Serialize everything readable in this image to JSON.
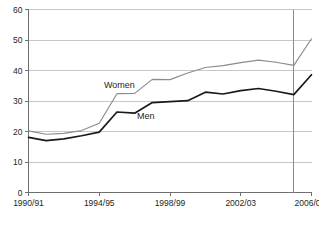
{
  "chart_data": {
    "type": "line",
    "title": "",
    "subtitle": "",
    "xlabel": "",
    "ylabel": "",
    "ylim": [
      0,
      60
    ],
    "ytick_step": 10,
    "yticks": [
      "0",
      "10",
      "20",
      "30",
      "40",
      "50",
      "60"
    ],
    "grid": true,
    "legend_position": "inline-labels",
    "categories": [
      "1990/91",
      "1991/92",
      "1992/93",
      "1993/94",
      "1994/95",
      "1995/96",
      "1996/97",
      "1997/98",
      "1998/99",
      "1999/00",
      "2000/01",
      "2001/02",
      "2002/03",
      "2003/04",
      "2004/05",
      "2005/06",
      "2006/07"
    ],
    "xtick_labels": [
      {
        "index": 0,
        "label": "1990/91",
        "superscript": ""
      },
      {
        "index": 4,
        "label": "1994/95",
        "superscript": ""
      },
      {
        "index": 8,
        "label": "1998/99",
        "superscript": ""
      },
      {
        "index": 12,
        "label": "2002/03",
        "superscript": ""
      },
      {
        "index": 16,
        "label": "2006/07",
        "superscript": "3"
      }
    ],
    "series": [
      {
        "name": "Women",
        "color": "#8c8c8c",
        "label_text": "Women",
        "values": [
          20.2,
          19.1,
          19.4,
          20.3,
          22.7,
          32.4,
          32.5,
          37.1,
          37.0,
          39.2,
          41.0,
          41.6,
          42.6,
          43.4,
          42.7,
          41.7,
          50.4
        ]
      },
      {
        "name": "Men",
        "color": "#1a1a1a",
        "label_text": "Men",
        "values": [
          18.1,
          17.0,
          17.6,
          18.6,
          19.8,
          26.4,
          26.0,
          29.5,
          29.8,
          30.1,
          32.9,
          32.3,
          33.4,
          34.1,
          33.2,
          32.1,
          38.6
        ]
      }
    ],
    "annotations": [
      {
        "name": "women-series-label",
        "text": "Women",
        "x": 104,
        "y": 88
      },
      {
        "name": "men-series-label",
        "text": "Men",
        "x": 137,
        "y": 119
      }
    ],
    "break_marker": {
      "name": "series-break-line",
      "at_index": 15
    }
  }
}
